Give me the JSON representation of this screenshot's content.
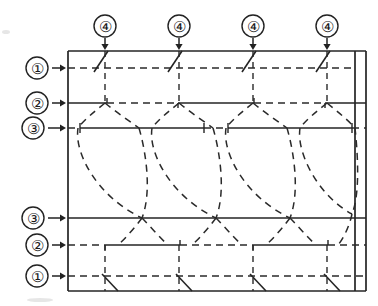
{
  "figure": {
    "kind": "technical-line-diagram",
    "background_color": "#ffffff",
    "ink_color": "#242424"
  },
  "left_callouts": [
    {
      "id": "callout-1-top",
      "label": "①",
      "cx": 37,
      "cy": 68,
      "arrow_from_x": 52,
      "arrow_to_x": 66,
      "arrow_y": 68
    },
    {
      "id": "callout-2-top",
      "label": "②",
      "cx": 37,
      "cy": 103,
      "arrow_from_x": 52,
      "arrow_to_x": 66,
      "arrow_y": 103
    },
    {
      "id": "callout-3-top",
      "label": "③",
      "cx": 33,
      "cy": 128,
      "arrow_from_x": 48,
      "arrow_to_x": 66,
      "arrow_y": 128
    },
    {
      "id": "callout-3-bottom",
      "label": "③",
      "cx": 33,
      "cy": 218,
      "arrow_from_x": 48,
      "arrow_to_x": 66,
      "arrow_y": 218
    },
    {
      "id": "callout-2-bottom",
      "label": "②",
      "cx": 37,
      "cy": 245,
      "arrow_from_x": 52,
      "arrow_to_x": 66,
      "arrow_y": 245
    },
    {
      "id": "callout-1-bottom",
      "label": "①",
      "cx": 37,
      "cy": 276,
      "arrow_from_x": 52,
      "arrow_to_x": 66,
      "arrow_y": 276
    }
  ],
  "top_callouts": [
    {
      "id": "callout-4-a",
      "label": "④",
      "cx": 105,
      "cy": 26,
      "arrow_from_y": 38,
      "arrow_to_y": 50
    },
    {
      "id": "callout-4-b",
      "label": "④",
      "cx": 179,
      "cy": 26,
      "arrow_from_y": 38,
      "arrow_to_y": 50
    },
    {
      "id": "callout-4-c",
      "label": "④",
      "cx": 253,
      "cy": 26,
      "arrow_from_y": 38,
      "arrow_to_y": 50
    },
    {
      "id": "callout-4-d",
      "label": "④",
      "cx": 327,
      "cy": 26,
      "arrow_from_y": 38,
      "arrow_to_y": 50
    }
  ],
  "frame": {
    "left_x": 68,
    "right_x": 366,
    "inner_right_x": 355,
    "top_y": 51,
    "bottom_y": 291
  },
  "layer_lines": [
    {
      "id": "line-1-top",
      "y": 68,
      "style": "dashed"
    },
    {
      "id": "line-2-top",
      "y": 103,
      "style": "mixed"
    },
    {
      "id": "line-3-top",
      "y": 128,
      "style": "mixed"
    },
    {
      "id": "line-3-bottom",
      "y": 218,
      "style": "solid"
    },
    {
      "id": "line-2-bottom",
      "y": 245,
      "style": "mixed"
    },
    {
      "id": "line-1-bottom",
      "y": 276,
      "style": "dashed"
    }
  ],
  "column_centers": [
    105,
    179,
    253,
    327
  ],
  "waist_positions": [
    142,
    216,
    290
  ],
  "hatch_marks": {
    "top_edge_count": 4,
    "bottom_edge_count": 4,
    "top_direction": "upper-right-to-lower-left",
    "bottom_direction": "upper-left-to-lower-right"
  },
  "legend_note": ""
}
